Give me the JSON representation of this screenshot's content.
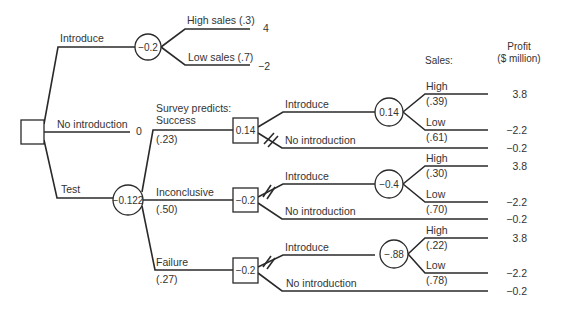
{
  "headers": {
    "sales": "Sales:",
    "profit_line1": "Profit",
    "profit_line2": "($ million)"
  },
  "root": {
    "type": "decision",
    "branches": {
      "introduce": {
        "label": "Introduce",
        "node_value": "−0.2",
        "high": {
          "label": "High sales (.3)",
          "payoff": "4"
        },
        "low": {
          "label": "Low sales (.7)",
          "payoff": "−2"
        }
      },
      "no_introduction": {
        "label": "No introduction",
        "payoff": "0"
      },
      "test": {
        "label": "Test",
        "node_value": "−0.122"
      }
    }
  },
  "survey": {
    "success": {
      "label_line1": "Survey predicts:",
      "label_line2": "Success",
      "prob": "(.23)",
      "decision_value": "0.14",
      "introduce_label": "Introduce",
      "chance_value": "0.14",
      "high_label": "High",
      "high_prob": "(.39)",
      "high_payoff": "3.8",
      "low_label": "Low",
      "low_prob": "(.61)",
      "low_payoff": "−2.2",
      "no_intro_label": "No introduction",
      "no_intro_payoff": "−0.2"
    },
    "inconclusive": {
      "label": "Inconclusive",
      "prob": "(.50)",
      "decision_value": "−0.2",
      "introduce_label": "Introduce",
      "chance_value": "−0.4",
      "high_label": "High",
      "high_prob": "(.30)",
      "high_payoff": "3.8",
      "low_label": "Low",
      "low_prob": "(.70)",
      "low_payoff": "−2.2",
      "no_intro_label": "No introduction",
      "no_intro_payoff": "−0.2"
    },
    "failure": {
      "label": "Failure",
      "prob": "(.27)",
      "decision_value": "−0.2",
      "introduce_label": "Introduce",
      "chance_value": "−.88",
      "high_label": "High",
      "high_prob": "(.22)",
      "high_payoff": "3.8",
      "low_label": "Low",
      "low_prob": "(.78)",
      "low_payoff": "−2.2",
      "no_intro_label": "No introduction",
      "no_intro_payoff": "−0.2"
    }
  },
  "colors": {
    "line": "#2a2a2a",
    "text": "#333333",
    "background": "#ffffff"
  }
}
